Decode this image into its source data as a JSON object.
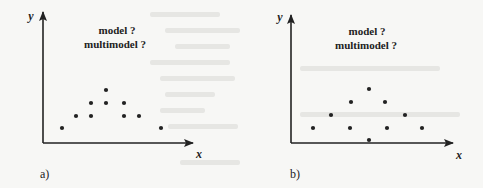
{
  "figure": {
    "panels": [
      {
        "id": "a",
        "tag": "a)",
        "x_label": "x",
        "y_label": "y",
        "question_lines": [
          "model ?",
          "multimodel ?"
        ],
        "axes": {
          "origin": [
            43,
            143
          ],
          "x_end": 193,
          "y_end": 12
        },
        "label_pos": {
          "line1": [
            117,
            34
          ],
          "line2": [
            115,
            48
          ],
          "x": [
            199,
            158
          ],
          "y": [
            31,
            20
          ],
          "tag": [
            40,
            178
          ]
        },
        "points": [
          [
            62,
            128
          ],
          [
            161,
            128
          ],
          [
            76,
            116
          ],
          [
            91,
            116
          ],
          [
            124,
            116
          ],
          [
            139,
            116
          ],
          [
            91,
            103
          ],
          [
            106,
            103
          ],
          [
            124,
            103
          ],
          [
            106,
            90
          ]
        ]
      },
      {
        "id": "b",
        "tag": "b)",
        "x_label": "x",
        "y_label": "y",
        "question_lines": [
          "model ?",
          "multimodel ?"
        ],
        "axes": {
          "origin": [
            291,
            143
          ],
          "x_end": 453,
          "y_end": 15
        },
        "label_pos": {
          "line1": [
            367,
            35
          ],
          "line2": [
            366,
            49
          ],
          "x": [
            459,
            159
          ],
          "y": [
            280,
            21
          ],
          "tag": [
            290,
            178
          ]
        },
        "points": [
          [
            313,
            128
          ],
          [
            350,
            128
          ],
          [
            387,
            128
          ],
          [
            422,
            128
          ],
          [
            331,
            115
          ],
          [
            405,
            115
          ],
          [
            351,
            102
          ],
          [
            385,
            102
          ],
          [
            369,
            89
          ],
          [
            369,
            140
          ]
        ]
      }
    ],
    "colors": {
      "ink": "#222222",
      "background": "#f7f7f5",
      "bleed": "#e6e6e3"
    }
  }
}
